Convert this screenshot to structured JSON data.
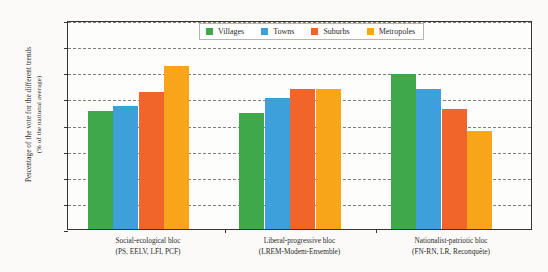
{
  "chart_data": {
    "type": "bar",
    "title": "",
    "xlabel": "",
    "ylabel": "Percentage of the vote for the different trends (% of the national average)",
    "ylabel_line1": "Percentage of the vote for the different trends",
    "ylabel_line2": "(% of the national average)",
    "ylim": [
      0,
      160
    ],
    "ytick_labels": [
      "0%",
      "20%",
      "40%",
      "60%",
      "80%",
      "100%",
      "120%",
      "140%",
      "160%"
    ],
    "ytick_values": [
      0,
      20,
      40,
      60,
      80,
      100,
      120,
      140,
      160
    ],
    "grid": true,
    "legend_position": "top-center",
    "categories": [
      "Social-ecological bloc (PS, EELV, LFI, PCF)",
      "Liberal-progressive bloc (LREM-Modem-Ensemble)",
      "Nationalist-patriotic bloc (FN-RN, LR, Reconquête)"
    ],
    "category_lines": [
      {
        "line1": "Social-ecological bloc",
        "line2": "(PS, EELV, LFI, PCF)"
      },
      {
        "line1": "Liberal-progressive bloc",
        "line2": "(LREM-Modem-Ensemble)"
      },
      {
        "line1": "Nationalist-patriotic bloc",
        "line2": "(FN-RN, LR, Reconquête)"
      }
    ],
    "series": [
      {
        "name": "Villages",
        "color": "#3ea84a",
        "values": [
          90,
          89,
          119
        ]
      },
      {
        "name": "Towns",
        "color": "#3da0db",
        "values": [
          94,
          100,
          107
        ]
      },
      {
        "name": "Suburbs",
        "color": "#f2652a",
        "values": [
          105,
          107,
          92
        ]
      },
      {
        "name": "Metropoles",
        "color": "#f9a51a",
        "values": [
          125,
          107,
          75
        ]
      }
    ]
  }
}
